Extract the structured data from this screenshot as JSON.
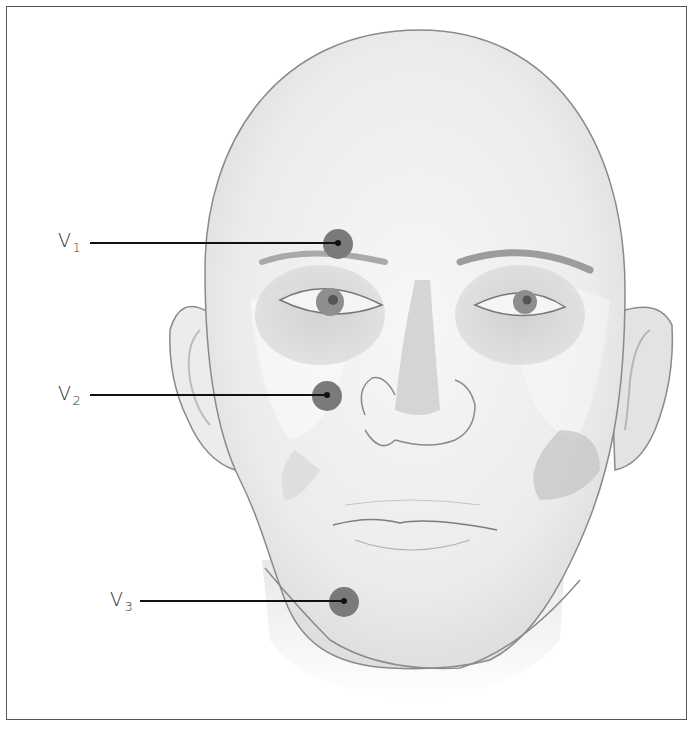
{
  "figure": {
    "type": "anatomical-illustration",
    "colors": {
      "frame": "#555555",
      "marker_fill": "#7a7a7a",
      "marker_center": "#111111",
      "leader_line": "#111111",
      "label_text": "#333333",
      "skin": "#efefef",
      "outline": "#8a8a8a"
    },
    "labels": [
      {
        "id": "V1",
        "base": "V",
        "sub": "1",
        "label_x": 58,
        "label_y": 233,
        "line_start": [
          90,
          243
        ],
        "point": [
          338,
          243
        ],
        "marker_radius": 15
      },
      {
        "id": "V2",
        "base": "V",
        "sub": "2",
        "label_x": 58,
        "label_y": 388,
        "line_start": [
          90,
          395
        ],
        "point": [
          327,
          395
        ],
        "marker_radius": 15
      },
      {
        "id": "V3",
        "base": "V",
        "sub": "3",
        "label_x": 110,
        "label_y": 593,
        "line_start": [
          140,
          601
        ],
        "point": [
          344,
          601
        ],
        "marker_radius": 15
      }
    ]
  }
}
